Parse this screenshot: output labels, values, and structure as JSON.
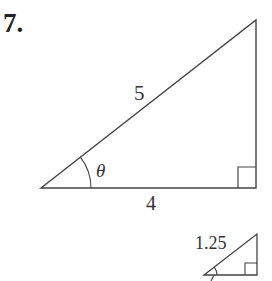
{
  "problem": {
    "number": "7."
  },
  "main_triangle": {
    "hypotenuse_label": "5",
    "adjacent_label": "4",
    "angle_label": "θ",
    "right_angle_marker": true
  },
  "small_triangle": {
    "hypotenuse_label": "1.25",
    "right_angle_marker": true
  },
  "colors": {
    "line": "#444444",
    "text": "#222222",
    "background": "#ffffff"
  }
}
